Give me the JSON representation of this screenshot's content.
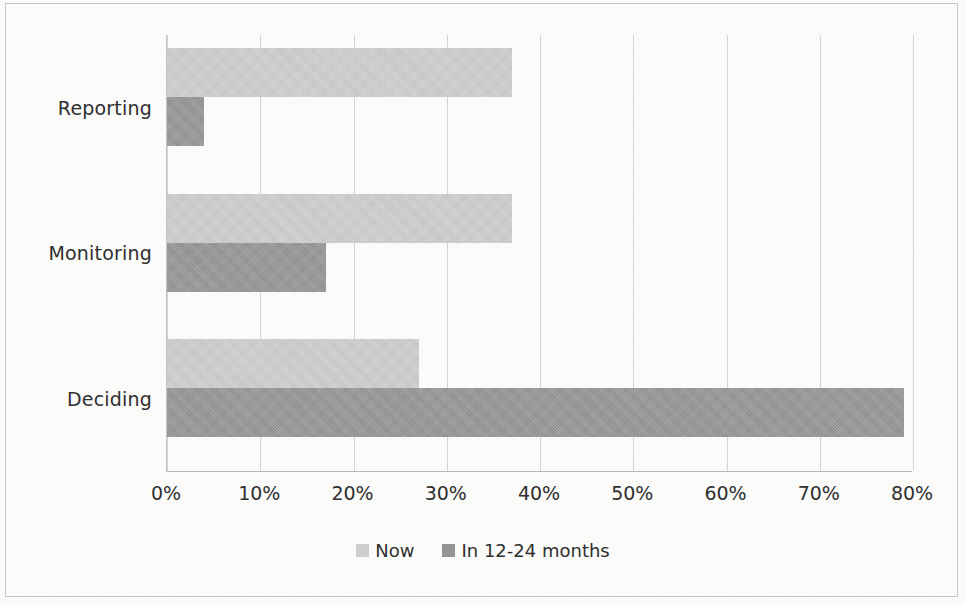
{
  "chart_data": {
    "type": "bar",
    "orientation": "horizontal",
    "title": "",
    "xlabel": "",
    "ylabel": "",
    "categories": [
      "Reporting",
      "Monitoring",
      "Deciding"
    ],
    "series": [
      {
        "name": "Now",
        "color": "#d0d0d0",
        "values": [
          37,
          37,
          27
        ]
      },
      {
        "name": "In 12-24 months",
        "color": "#969696",
        "values": [
          4,
          17,
          79
        ]
      }
    ],
    "xlim": [
      0,
      80
    ],
    "xtick_values": [
      0,
      10,
      20,
      30,
      40,
      50,
      60,
      70,
      80
    ],
    "xtick_labels": [
      "0%",
      "10%",
      "20%",
      "30%",
      "40%",
      "50%",
      "60%",
      "70%",
      "80%"
    ],
    "value_suffix": "%",
    "grid": "vertical",
    "legend_position": "bottom",
    "category_order_top_to_bottom": [
      "Reporting",
      "Monitoring",
      "Deciding"
    ]
  },
  "axis": {
    "categories": [
      {
        "label": "Reporting"
      },
      {
        "label": "Monitoring"
      },
      {
        "label": "Deciding"
      }
    ],
    "ticks": [
      {
        "label": "0%"
      },
      {
        "label": "10%"
      },
      {
        "label": "20%"
      },
      {
        "label": "30%"
      },
      {
        "label": "40%"
      },
      {
        "label": "50%"
      },
      {
        "label": "60%"
      },
      {
        "label": "70%"
      },
      {
        "label": "80%"
      }
    ]
  },
  "legend": {
    "items": [
      {
        "label": "Now",
        "color": "#d0d0d0"
      },
      {
        "label": "In 12-24 months",
        "color": "#969696"
      }
    ]
  }
}
